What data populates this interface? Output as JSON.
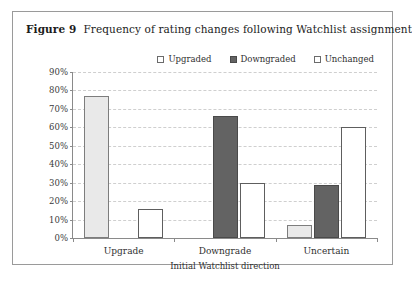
{
  "figure": {
    "label": "Figure 9",
    "caption": "Frequency of rating changes following Watchlist assignment"
  },
  "chart_data": {
    "type": "bar",
    "title": "Frequency of rating changes following Watchlist assignment",
    "xlabel": "Initial Watchlist direction",
    "ylabel": "",
    "categories": [
      "Upgrade",
      "Downgrade",
      "Uncertain"
    ],
    "series": [
      {
        "name": "Upgraded",
        "color": "#e9e9e9",
        "values": [
          77,
          0,
          7
        ]
      },
      {
        "name": "Downgraded",
        "color": "#636363",
        "values": [
          0,
          66,
          29
        ]
      },
      {
        "name": "Unchanged",
        "color": "#ffffff",
        "values": [
          16,
          30,
          60
        ]
      }
    ],
    "ylim": [
      0,
      90
    ],
    "yticks": [
      "0%",
      "10%",
      "20%",
      "30%",
      "40%",
      "50%",
      "60%",
      "70%",
      "80%",
      "90%"
    ],
    "ytick_values": [
      0,
      10,
      20,
      30,
      40,
      50,
      60,
      70,
      80,
      90
    ],
    "grid": true,
    "legend_position": "top-right"
  }
}
